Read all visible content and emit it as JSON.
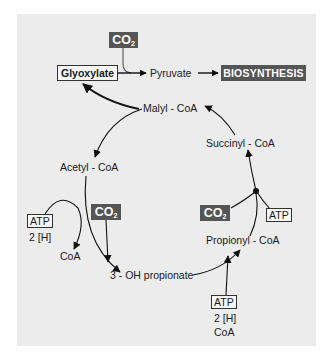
{
  "diagram": {
    "nodes": {
      "co2_top": {
        "main": "CO",
        "sub": "2"
      },
      "glyoxylate": "Glyoxylate",
      "pyruvate": "Pyruvate",
      "biosynthesis": "BIOSYNTHESIS",
      "malyl_coa": "Malyl - CoA",
      "succinyl_coa": "Succinyl - CoA",
      "acetyl_coa": "Acetyl - CoA",
      "atp_left": "ATP",
      "h2_left": "2 [H]",
      "coa_left": "CoA",
      "co2_left": {
        "main": "CO",
        "sub": "2"
      },
      "oh_propionate": "3 - OH propionate",
      "co2_right": {
        "main": "CO",
        "sub": "2"
      },
      "atp_right": "ATP",
      "propionyl_coa": "Propionyl - CoA",
      "atp_bottom": "ATP",
      "h2_bottom": "2 [H]",
      "coa_bottom": "CoA"
    },
    "edges": [
      {
        "from": "Glyoxylate",
        "to": "Pyruvate",
        "cofactor": "CO2"
      },
      {
        "from": "Pyruvate",
        "to": "BIOSYNTHESIS"
      },
      {
        "from": "Malyl - CoA",
        "to": "Glyoxylate"
      },
      {
        "from": "Malyl - CoA",
        "to": "Acetyl - CoA"
      },
      {
        "from": "Acetyl - CoA",
        "to": "3 - OH propionate",
        "cofactors": [
          "CO2",
          "ATP",
          "2 [H]"
        ],
        "product": "CoA"
      },
      {
        "from": "3 - OH propionate",
        "to": "Propionyl - CoA",
        "cofactors": [
          "ATP",
          "2 [H]",
          "CoA"
        ]
      },
      {
        "from": "Propionyl - CoA",
        "to": "Succinyl - CoA",
        "cofactors": [
          "CO2",
          "ATP"
        ]
      },
      {
        "from": "Succinyl - CoA",
        "to": "Malyl - CoA"
      }
    ],
    "colors": {
      "panel": "#ececec",
      "dark_box": "#555555",
      "line": "#1a1a1a"
    }
  }
}
